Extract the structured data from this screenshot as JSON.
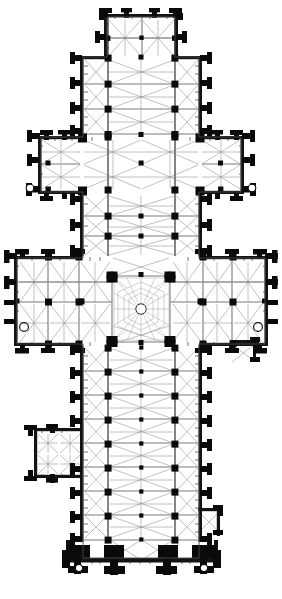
{
  "document": {
    "type": "architectural-floor-plan",
    "subject": "Gothic cathedral ground plan",
    "orientation": "liturgical east at top, west front at bottom",
    "background_color": "#ffffff",
    "ink_color": "#0a0a0a",
    "rib_color": "#8d8d8d",
    "caption": ""
  },
  "plan": {
    "overall": {
      "width_px": 282,
      "height_px": 599,
      "shape": "Latin cross with double transepts",
      "drawn_bounds": {
        "x": 18,
        "y": 8,
        "w": 250,
        "h": 575
      }
    },
    "sections": [
      {
        "name": "lady-chapel",
        "label": "Lady Chapel / eastern chapel",
        "position": "far east (top)",
        "bays": 2,
        "bounds": {
          "x": 104,
          "y": 14,
          "w": 74,
          "h": 44
        }
      },
      {
        "name": "presbytery",
        "label": "Presbytery / retrochoir",
        "position": "east arm",
        "bays": 3,
        "aisles": 2,
        "bounds": {
          "x": 80,
          "y": 58,
          "w": 122,
          "h": 78
        }
      },
      {
        "name": "eastern-transept",
        "label": "Eastern (minor) transept",
        "position": "upper crossing arms",
        "arms": 2,
        "bounds": {
          "x": 38,
          "y": 136,
          "w": 206,
          "h": 58
        }
      },
      {
        "name": "choir",
        "label": "Choir",
        "position": "between transepts",
        "bays": 3,
        "bounds": {
          "x": 80,
          "y": 194,
          "w": 122,
          "h": 62
        }
      },
      {
        "name": "main-transept",
        "label": "Main (great) transept",
        "position": "middle",
        "arms": 2,
        "bays_per_arm": 3,
        "bounds": {
          "x": 14,
          "y": 256,
          "w": 254,
          "h": 90
        }
      },
      {
        "name": "crossing",
        "label": "Crossing under central tower",
        "vault": "octopartite radial vault with circular oculus",
        "bounds": {
          "x": 112,
          "y": 276,
          "w": 58,
          "h": 66
        }
      },
      {
        "name": "nave",
        "label": "Nave with north and south aisles",
        "bays": 8,
        "aisles": 2,
        "bounds": {
          "x": 80,
          "y": 346,
          "w": 122,
          "h": 194
        }
      },
      {
        "name": "north-porch",
        "label": "North porch",
        "position": "left of nave",
        "bays": 2,
        "bounds": {
          "x": 34,
          "y": 428,
          "w": 48,
          "h": 50
        }
      },
      {
        "name": "west-front",
        "label": "West front with twin tower bases and three portals",
        "portals": 3,
        "bounds": {
          "x": 66,
          "y": 540,
          "w": 152,
          "h": 42
        }
      }
    ],
    "features": {
      "buttress_count_nave_each_side": 9,
      "corner_turrets": 4,
      "turret_note": "small circular stair turrets at transept corners",
      "pier_style": "solid black compound piers",
      "vault_style": "quadripartite rib vaults, drawn as crossed diagonals",
      "wall_fill": "solid black masonry poche"
    },
    "legend": {
      "solid_black": "masonry wall / pier",
      "thin_grey_diagonal": "vault rib above",
      "open_circle": "spiral stair turret",
      "double_grey_line": "arcade / transverse arch"
    }
  }
}
